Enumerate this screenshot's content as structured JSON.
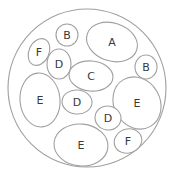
{
  "diagram": {
    "type": "nested-ellipses",
    "outer": {
      "cx": 87,
      "cy": 88,
      "r": 79
    },
    "colors": {
      "stroke": "#a0a0a0",
      "text": "#3a3a3a",
      "background": "#ffffff"
    },
    "regions": [
      {
        "id": "a",
        "label": "A",
        "cx": 112,
        "cy": 42,
        "rx": 26,
        "ry": 19,
        "rot": 18
      },
      {
        "id": "b-top",
        "label": "B",
        "cx": 67,
        "cy": 35,
        "rx": 11,
        "ry": 11,
        "rot": 0
      },
      {
        "id": "b-right",
        "label": "B",
        "cx": 146,
        "cy": 67,
        "rx": 11,
        "ry": 12,
        "rot": 0
      },
      {
        "id": "f-top",
        "label": "F",
        "cx": 39,
        "cy": 52,
        "rx": 10,
        "ry": 14,
        "rot": 25
      },
      {
        "id": "d-upper",
        "label": "D",
        "cx": 59,
        "cy": 64,
        "rx": 12,
        "ry": 15,
        "rot": 0
      },
      {
        "id": "c",
        "label": "C",
        "cx": 91,
        "cy": 76,
        "rx": 22,
        "ry": 15,
        "rot": 5
      },
      {
        "id": "e-left",
        "label": "E",
        "cx": 40,
        "cy": 100,
        "rx": 20,
        "ry": 27,
        "rot": -5
      },
      {
        "id": "d-mid",
        "label": "D",
        "cx": 77,
        "cy": 102,
        "rx": 15,
        "ry": 12,
        "rot": 5
      },
      {
        "id": "e-right",
        "label": "E",
        "cx": 137,
        "cy": 103,
        "rx": 23,
        "ry": 27,
        "rot": -30
      },
      {
        "id": "d-lower",
        "label": "D",
        "cx": 108,
        "cy": 118,
        "rx": 13,
        "ry": 12,
        "rot": 10
      },
      {
        "id": "e-bottom",
        "label": "E",
        "cx": 81,
        "cy": 145,
        "rx": 27,
        "ry": 21,
        "rot": 5
      },
      {
        "id": "f-bottom",
        "label": "F",
        "cx": 128,
        "cy": 141,
        "rx": 14,
        "ry": 12,
        "rot": -20
      }
    ]
  }
}
